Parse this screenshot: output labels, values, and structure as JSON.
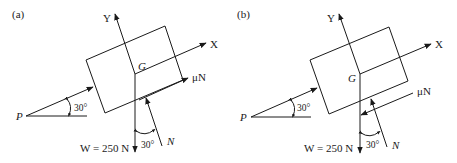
{
  "figure": {
    "panels": [
      {
        "id": "a",
        "label": "(a)",
        "axis_y": "Y",
        "axis_x": "X",
        "center_label": "G",
        "force_p": "P",
        "angle_p": "30°",
        "friction_label": "μN",
        "friction_direction": "up-slope",
        "normal_label": "N",
        "angle_n": "30°",
        "weight_label": "W = 250 N"
      },
      {
        "id": "b",
        "label": "(b)",
        "axis_y": "Y",
        "axis_x": "X",
        "center_label": "G",
        "force_p": "P",
        "angle_p": "30°",
        "friction_label": "μN",
        "friction_direction": "down-slope",
        "normal_label": "N",
        "angle_n": "30°",
        "weight_label": "W = 250 N"
      }
    ]
  }
}
